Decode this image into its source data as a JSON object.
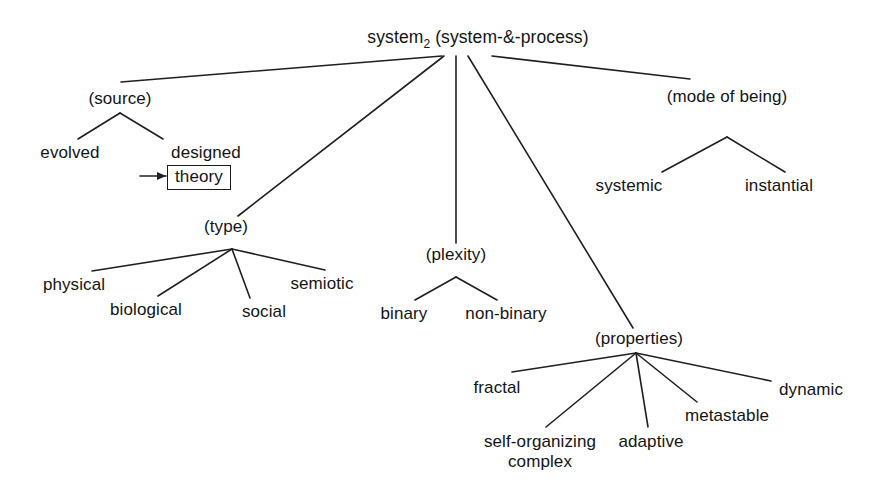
{
  "diagram": {
    "title_text": "system₂ (system-&-process)",
    "root": {
      "label_main": "system",
      "label_sub": "2",
      "label_rest": " (system-&-process)"
    },
    "branches": {
      "source": {
        "label": "(source)",
        "children": [
          {
            "label": "evolved"
          },
          {
            "label": "designed"
          }
        ],
        "annotation": {
          "label": "theory",
          "marker": "arrow-right-icon"
        }
      },
      "type": {
        "label": "(type)",
        "children": [
          {
            "label": "physical"
          },
          {
            "label": "biological"
          },
          {
            "label": "social"
          },
          {
            "label": "semiotic"
          }
        ]
      },
      "plexity": {
        "label": "(plexity)",
        "children": [
          {
            "label": "binary"
          },
          {
            "label": "non-binary"
          }
        ]
      },
      "properties": {
        "label": "(properties)",
        "children": [
          {
            "label": "fractal"
          },
          {
            "label_line1": "self-organizing",
            "label_line2": "complex"
          },
          {
            "label": "adaptive"
          },
          {
            "label": "metastable"
          },
          {
            "label": "dynamic"
          }
        ]
      },
      "mode_of_being": {
        "label": "(mode of being)",
        "children": [
          {
            "label": "systemic"
          },
          {
            "label": "instantial"
          }
        ]
      }
    },
    "colors": {
      "line": "#1f1f1f",
      "text": "#141414",
      "background": "#ffffff"
    }
  }
}
